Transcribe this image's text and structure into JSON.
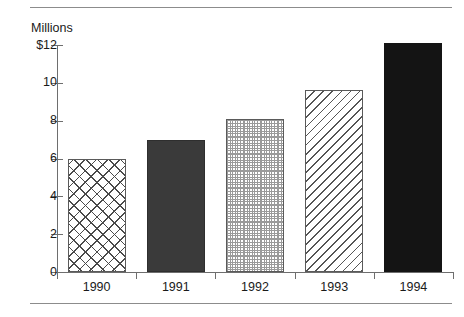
{
  "chart_data": {
    "type": "bar",
    "title": "",
    "subtitle": "",
    "xlabel": "",
    "ylabel": "Millions",
    "categories": [
      "1990",
      "1991",
      "1992",
      "1993",
      "1994"
    ],
    "values": [
      6.0,
      7.0,
      8.1,
      9.6,
      12.1
    ],
    "series": [
      {
        "name": "Millions",
        "values": [
          6.0,
          7.0,
          8.1,
          9.6,
          12.1
        ]
      }
    ],
    "ylim": [
      0,
      12
    ],
    "y_ticks": [
      0,
      2,
      4,
      6,
      8,
      10,
      12
    ],
    "y_tick_labels": [
      "0",
      "2",
      "4",
      "6",
      "8",
      "10",
      "$12"
    ],
    "grid": false,
    "legend": "none",
    "bar_fills": [
      "crosshatch",
      "dark-solid",
      "dotted-grid",
      "diagonal-hatch",
      "black-solid"
    ],
    "colors": {
      "axis": "#6e6e6e",
      "rule": "#8c8c8c",
      "text": "#1a1a1a",
      "bar_outline": "#5a5a5a",
      "dark_solid": "#3a3a3a",
      "black_solid": "#141414",
      "hatch": "#4a4a4a",
      "dot_grid": "#9a9a9a"
    }
  },
  "frame": {
    "top_rule": "",
    "bottom_rule": ""
  }
}
